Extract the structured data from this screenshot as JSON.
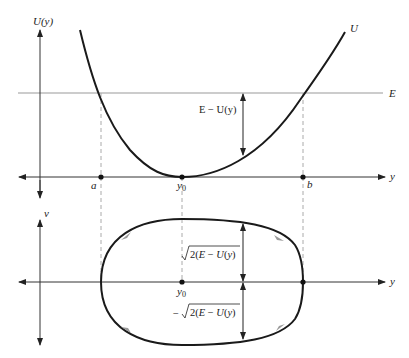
{
  "top_panel": {
    "vertical_axis_label": "U(y)",
    "horizontal_axis_label": "y",
    "energy_line_label": "E",
    "curve_label": "U",
    "gap_label": "E − U(y)",
    "points": [
      {
        "label": "a",
        "x": 101
      },
      {
        "label": "y0",
        "x": 182
      },
      {
        "label": "b",
        "x": 303
      }
    ]
  },
  "bottom_panel": {
    "vertical_axis_label": "v",
    "horizontal_axis_label": "y",
    "center_label": "y0",
    "upper_label": "√2(E − U(y)",
    "lower_label": "−√2(E − U(y)"
  },
  "colors": {
    "axis": "#333333",
    "energy_line": "#999999",
    "curve": "#1a1a1a",
    "dashed": "#aaaaaa",
    "flow_arrow": "#9a9a9a"
  }
}
